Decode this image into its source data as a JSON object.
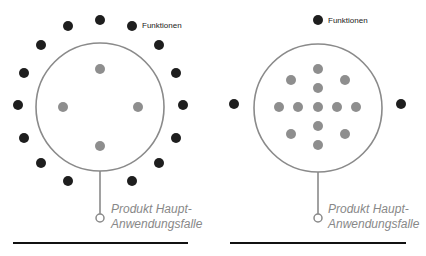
{
  "colors": {
    "feature_dot": "#1e1e1e",
    "usecase_dot": "#8e8e8e",
    "circle_stroke": "#8a8a8a",
    "label_gray": "#888888",
    "baseline": "#111111"
  },
  "diagrams": [
    {
      "id": "left",
      "features_label": "Funktionen",
      "product_label_line1": "Produkt Haupt-",
      "product_label_line2": "Anwendungsfalle",
      "circle": {
        "cx": 100,
        "cy": 107,
        "r": 64
      },
      "inner_dots": [
        [
          100,
          69
        ],
        [
          63,
          107
        ],
        [
          138,
          107
        ],
        [
          100,
          146
        ]
      ],
      "outer_dots": [
        [
          100,
          20
        ],
        [
          68,
          26
        ],
        [
          132,
          26
        ],
        [
          41,
          45
        ],
        [
          159,
          45
        ],
        [
          24,
          73
        ],
        [
          176,
          73
        ],
        [
          18,
          105
        ],
        [
          183,
          105
        ],
        [
          24,
          138
        ],
        [
          176,
          138
        ],
        [
          41,
          163
        ],
        [
          159,
          163
        ],
        [
          68,
          181
        ],
        [
          132,
          181
        ]
      ]
    },
    {
      "id": "right",
      "features_label": "Funktionen",
      "product_label_line1": "Produkt Haupt-",
      "product_label_line2": "Anwendungsfalle",
      "circle": {
        "cx": 318,
        "cy": 108,
        "r": 64
      },
      "inner_dots": [
        [
          318,
          69
        ],
        [
          291,
          80
        ],
        [
          345,
          80
        ],
        [
          318,
          88
        ],
        [
          279,
          107
        ],
        [
          298,
          107
        ],
        [
          318,
          107
        ],
        [
          337,
          107
        ],
        [
          356,
          107
        ],
        [
          318,
          126
        ],
        [
          291,
          134
        ],
        [
          345,
          134
        ],
        [
          318,
          145
        ]
      ],
      "outer_dots": [
        [
          318,
          20
        ],
        [
          234,
          104
        ],
        [
          401,
          104
        ]
      ]
    }
  ]
}
